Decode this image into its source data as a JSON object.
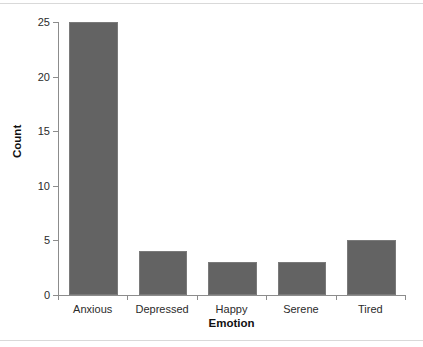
{
  "chart_data": {
    "type": "bar",
    "title": "",
    "subtitle": "",
    "xlabel": "Emotion",
    "ylabel": "Count",
    "categories": [
      "Anxious",
      "Depressed",
      "Happy",
      "Serene",
      "Tired"
    ],
    "values": [
      25,
      4,
      3,
      3,
      5
    ],
    "series": [
      {
        "name": "Count",
        "values": [
          25,
          4,
          3,
          3,
          5
        ]
      }
    ],
    "ylim": [
      0,
      25
    ],
    "xlim": [
      0,
      5
    ],
    "ytick_labels": [
      "0",
      "5",
      "10",
      "15",
      "20",
      "25"
    ],
    "ytick_values": [
      0,
      5,
      10,
      15,
      20,
      25
    ],
    "grid": false,
    "legend": false,
    "legend_position": "none",
    "orientation": "vertical",
    "annotations": [],
    "colors": {
      "bar_fill": "#636363",
      "bar_edge": "#7a7a7a",
      "axis": "#8c8c8c",
      "tick_text": "#2b2b2b",
      "title_text": "#111111",
      "background": "#ffffff",
      "frame_rule": "#d9d9d9"
    }
  }
}
